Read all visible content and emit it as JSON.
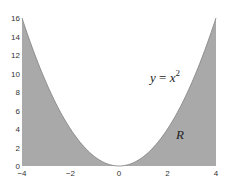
{
  "chart_data": {
    "type": "area",
    "title": "",
    "xlabel": "",
    "ylabel": "",
    "xlim": [
      -4,
      4
    ],
    "ylim": [
      0,
      16
    ],
    "grid": false,
    "x_ticks": [
      -4,
      -2,
      0,
      2,
      4
    ],
    "x_tick_labels": [
      "-4",
      "-2",
      "0",
      "2",
      "4"
    ],
    "y_ticks": [
      0,
      2,
      4,
      6,
      8,
      10,
      12,
      14,
      16
    ],
    "y_tick_labels": [
      "0",
      "2",
      "4",
      "6",
      "8",
      "10",
      "12",
      "14",
      "16"
    ],
    "series": [
      {
        "name": "y = x^2",
        "function": "x^2",
        "x": [
          -4,
          -3,
          -2,
          -1,
          0,
          1,
          2,
          3,
          4
        ],
        "y": [
          16,
          9,
          4,
          1,
          0,
          1,
          4,
          9,
          16
        ],
        "fill": "region between curve and x-axis (shaded, below curve)"
      }
    ],
    "annotations": [
      {
        "text": "y = x²",
        "x": 2.6,
        "y": 9.5
      },
      {
        "text": "R",
        "x": 2.6,
        "y": 3.2
      }
    ],
    "colors": {
      "fill": "#a9a9a9",
      "curve": "#808080",
      "background": "#ffffff"
    }
  },
  "labels": {
    "curve_label_y": "y",
    "curve_label_eq": " = ",
    "curve_label_x": "x",
    "curve_label_exp": "2",
    "region_label": "R"
  }
}
